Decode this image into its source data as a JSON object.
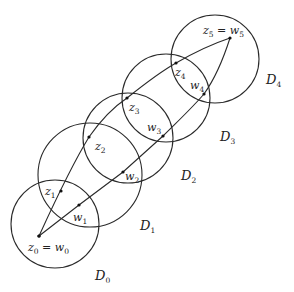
{
  "diagram": {
    "type": "chain-of-disks",
    "disks": [
      {
        "name": "D",
        "sub": "0",
        "cx": 55,
        "cy": 224,
        "r": 44,
        "label_x": 95,
        "label_y": 280
      },
      {
        "name": "D",
        "sub": "1",
        "cx": 90,
        "cy": 175,
        "r": 52,
        "label_x": 140,
        "label_y": 230
      },
      {
        "name": "D",
        "sub": "2",
        "cx": 128,
        "cy": 138,
        "r": 45,
        "label_x": 181,
        "label_y": 180
      },
      {
        "name": "D",
        "sub": "3",
        "cx": 166,
        "cy": 98,
        "r": 44,
        "label_x": 220,
        "label_y": 141
      },
      {
        "name": "D",
        "sub": "4",
        "cx": 215,
        "cy": 59,
        "r": 44,
        "label_x": 266,
        "label_y": 84
      }
    ],
    "z_points": [
      {
        "name": "z",
        "sub": "0",
        "x": 39,
        "y": 236
      },
      {
        "name": "z",
        "sub": "1",
        "x": 61,
        "y": 191,
        "label_x": 45,
        "label_y": 195
      },
      {
        "name": "z",
        "sub": "2",
        "x": 89,
        "y": 137,
        "label_x": 95,
        "label_y": 150
      },
      {
        "name": "z",
        "sub": "3",
        "x": 127,
        "y": 98,
        "label_x": 129,
        "label_y": 111
      },
      {
        "name": "z",
        "sub": "4",
        "x": 176,
        "y": 63,
        "label_x": 175,
        "label_y": 76
      },
      {
        "name": "z",
        "sub": "5",
        "x": 230,
        "y": 38
      }
    ],
    "w_points": [
      {
        "name": "w",
        "sub": "0",
        "x": 39,
        "y": 236
      },
      {
        "name": "w",
        "sub": "1",
        "x": 79,
        "y": 205,
        "label_x": 73,
        "label_y": 221
      },
      {
        "name": "w",
        "sub": "2",
        "x": 123,
        "y": 172,
        "label_x": 125,
        "label_y": 180
      },
      {
        "name": "w",
        "sub": "3",
        "x": 163,
        "y": 136,
        "label_x": 147,
        "label_y": 131
      },
      {
        "name": "w",
        "sub": "4",
        "x": 204,
        "y": 94,
        "label_x": 190,
        "label_y": 89
      }
    ],
    "start_label": {
      "lhs": "z",
      "lhs_sub": "0",
      "eq": " = ",
      "rhs": "w",
      "rhs_sub": "0",
      "x": 28,
      "y": 251
    },
    "end_label": {
      "lhs": "z",
      "lhs_sub": "5",
      "eq": " = ",
      "rhs": "w",
      "rhs_sub": "5",
      "x": 203,
      "y": 34
    },
    "z_curve": "M39,236 C50,212 70,168 89,137 C103,117 115,106 127,98 C142,86 160,72 176,63 C195,52 212,44 230,38",
    "w_curve": "M39,236 L79,205 L123,172 L163,136 C178,121 192,108 204,94 C214,80 223,60 230,38",
    "stroke_color": "#2a2a2a"
  }
}
